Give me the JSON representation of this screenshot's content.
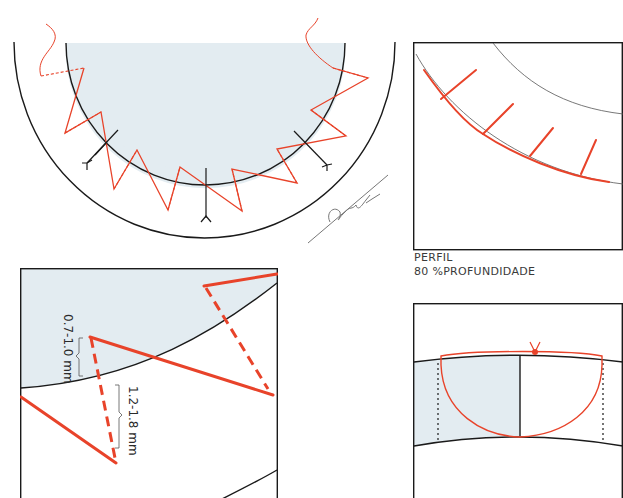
{
  "colors": {
    "suture_red": "#e8432a",
    "tissue_blue": "#e3ecf1",
    "line_black": "#1a1a1a",
    "caption_gray": "#3a3a3a",
    "thin_gray": "#555555"
  },
  "panels": {
    "overview": {
      "description": "Semicircular wound closure with continuous zigzag suture and three anchor needles",
      "signature": "Starck"
    },
    "profile": {
      "caption_line1": "PERFIL",
      "caption_line2": "80 %PROFUNDIDADE"
    },
    "detail": {
      "dimension_superficial": "0.7-1.0 mm",
      "dimension_deep": "1.2-1.8 mm"
    },
    "knot": {
      "description": "Loop closure tied with knot at top"
    }
  }
}
